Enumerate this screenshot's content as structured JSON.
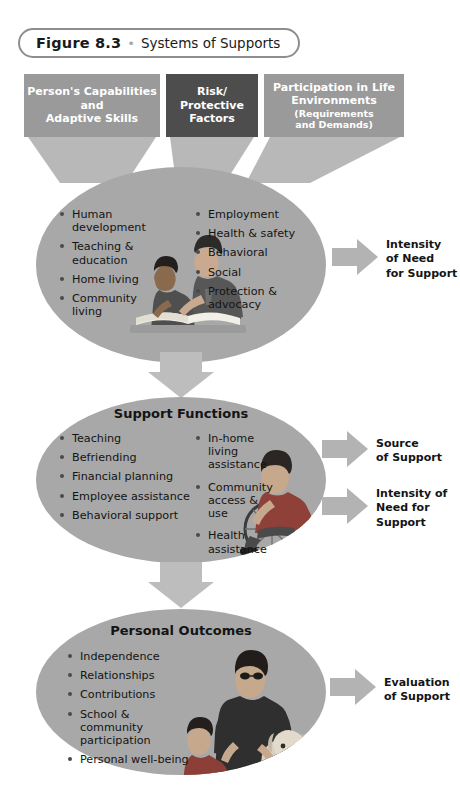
{
  "figure": {
    "number_label": "Figure 8.3",
    "separator": "•",
    "title": "Systems of Supports"
  },
  "top_boxes": [
    {
      "name": "persons-capabilities",
      "line1": "Person's Capabilities",
      "line2": "and",
      "line3": "Adaptive Skills",
      "color": "#9a9a9a"
    },
    {
      "name": "risk-protective-factors",
      "line1": "Risk/",
      "line2": "Protective",
      "line3": "Factors",
      "color": "#4d4d4d"
    },
    {
      "name": "participation-in-life-environments",
      "line1": "Participation in Life",
      "line2": "Environments",
      "sub1": "(Requirements",
      "sub2": "and Demands)",
      "color": "#9a9a9a"
    }
  ],
  "ellipses": [
    {
      "name": "support-areas",
      "title": "",
      "left_bullets": [
        "Human development",
        "Teaching & education",
        "Home living",
        "Community living"
      ],
      "right_bullets": [
        "Employment",
        "Health & safety",
        "Behavioral",
        "Social",
        "Protection & advocacy"
      ],
      "illustration": "mother-and-child-reading-illustration"
    },
    {
      "name": "support-functions",
      "title": "Support Functions",
      "left_bullets": [
        "Teaching",
        "Befriending",
        "Financial planning",
        "Employee assistance",
        "Behavioral support"
      ],
      "right_bullets": [
        "In-home living assistance",
        "Community access & use",
        "Health assistance"
      ],
      "illustration": "person-in-wheelchair-illustration"
    },
    {
      "name": "personal-outcomes",
      "title": "Personal Outcomes",
      "left_bullets": [
        "Independence",
        "Relationships",
        "Contributions",
        "School & community participation",
        "Personal well-being"
      ],
      "right_bullets": [],
      "illustration": "man-child-and-dog-illustration"
    }
  ],
  "side_labels": [
    {
      "name": "intensity-of-need-for-support-1",
      "line1": "Intensity",
      "line2": "of Need",
      "line3": "for Support"
    },
    {
      "name": "source-of-support",
      "line1": "Source",
      "line2": "of Support",
      "line3": ""
    },
    {
      "name": "intensity-of-need-for-support-2",
      "line1": "Intensity of",
      "line2": "Need for",
      "line3": "Support"
    },
    {
      "name": "evaluation-of-support",
      "line1": "Evaluation",
      "line2": "of Support",
      "line3": ""
    }
  ],
  "colors": {
    "box_light": "#9a9a9a",
    "box_dark": "#4d4d4d",
    "ellipse_fill": "#a8a8a8",
    "arrow_fill": "#b3b3b3",
    "connector_fill": "#bdbdbd",
    "text_dark": "#141414",
    "background": "#ffffff"
  }
}
